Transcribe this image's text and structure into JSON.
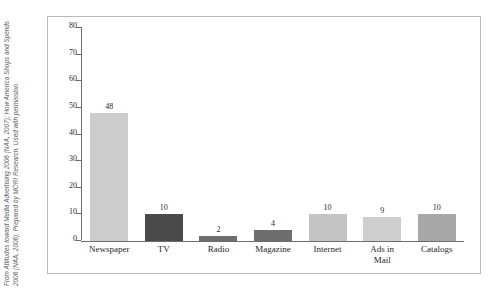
{
  "credit": {
    "text": "From Attitudes toward Media Advertising 2006 (NAA, 2007); How America Shops and Spends 2006 (NAA, 2006). Prepared by MORI Research. Used with permission."
  },
  "chart_data": {
    "type": "bar",
    "title": "",
    "subtitle": "",
    "xlabel": "",
    "ylabel": "",
    "ylim": [
      0,
      80
    ],
    "yticks": [
      "0",
      "10",
      "20",
      "30",
      "40",
      "50",
      "60",
      "70",
      "80"
    ],
    "grid": false,
    "legend": "none",
    "categories": [
      "Newspaper",
      "TV",
      "Radio",
      "Magazine",
      "Internet",
      "Ads in Mail",
      "Catalogs"
    ],
    "category_lines": [
      [
        "Newspaper"
      ],
      [
        "TV"
      ],
      [
        "Radio"
      ],
      [
        "Magazine"
      ],
      [
        "Internet"
      ],
      [
        "Ads in",
        "Mail"
      ],
      [
        "Catalogs"
      ]
    ],
    "values": [
      48,
      10,
      2,
      4,
      10,
      9,
      10
    ],
    "value_labels": [
      "48",
      "10",
      "2",
      "4",
      "10",
      "9",
      "10"
    ],
    "bar_colors": [
      "#cccccc",
      "#4a4a4a",
      "#6e6e6e",
      "#6e6e6e",
      "#c4c4c4",
      "#cfcfcf",
      "#a8a8a8"
    ],
    "axis_color": "#6d6d6d",
    "frame_color": "#b9b9b9",
    "background": "#ffffff"
  }
}
